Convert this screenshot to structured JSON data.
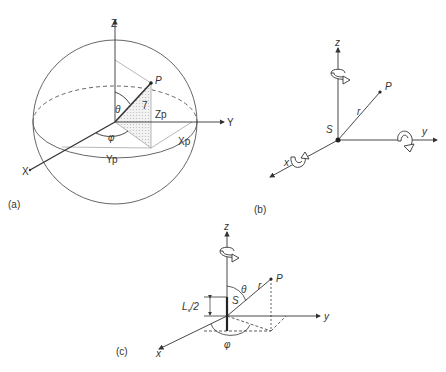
{
  "panels": {
    "a": {
      "tag": "(a)",
      "axes": {
        "z": "Z",
        "y": "Y",
        "x": "X"
      },
      "point": "P",
      "radius_label": "7",
      "angles": {
        "theta": "θ",
        "phi": "φ"
      },
      "coords": {
        "zp": "Zp",
        "xp": "Xp",
        "yp": "Yp"
      }
    },
    "b": {
      "tag": "(b)",
      "axes": {
        "z": "z",
        "y": "y",
        "x": "x"
      },
      "point": "P",
      "radius_label": "r",
      "source": "S"
    },
    "c": {
      "tag": "(c)",
      "axes": {
        "z": "z",
        "y": "y",
        "x": "x"
      },
      "point": "P",
      "radius_label": "r",
      "source": "S",
      "angles": {
        "theta": "θ",
        "phi": "φ"
      },
      "length_label": "L",
      "length_sub": "s",
      "length_suffix": "/2"
    }
  },
  "colors": {
    "line": "#333333",
    "light": "#9a9a9a",
    "shade": "#d8d8d8"
  }
}
